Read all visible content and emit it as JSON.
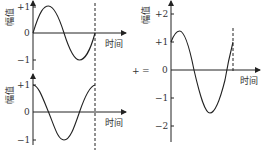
{
  "diagram": {
    "operator_plus": "+",
    "operator_equals": "=",
    "panels": [
      {
        "id": "wave-1",
        "y_label": "幅值",
        "x_label": "时间",
        "y_ticks": [
          "+1",
          "0",
          "−1"
        ],
        "description": "sine wave starting at 0, amplitude 1, one period"
      },
      {
        "id": "wave-2",
        "y_label": "幅值",
        "x_label": "时间",
        "y_ticks": [
          "+1",
          "0",
          "−1"
        ],
        "description": "cosine wave starting at +1, amplitude 1, one period"
      },
      {
        "id": "sum-wave",
        "y_label": "幅值",
        "x_label": "时间",
        "y_ticks": [
          "+2",
          "+1",
          "0",
          "−1",
          "−2"
        ],
        "description": "sum of the two waves, amplitude ≈1.41, starting at +1"
      }
    ],
    "colors": {
      "line": "#222222",
      "text": "#333333"
    }
  }
}
